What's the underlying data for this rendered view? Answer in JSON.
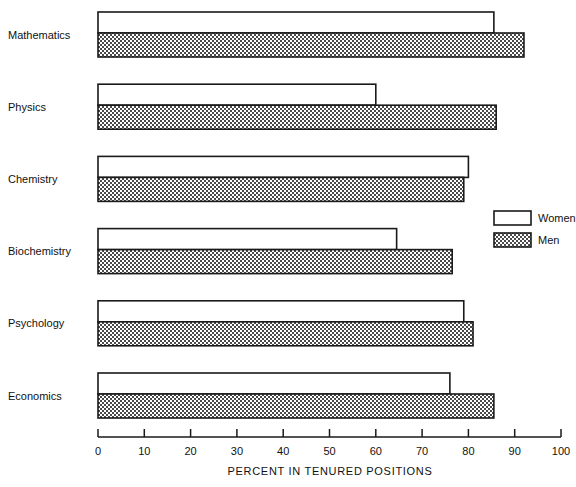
{
  "chart_data": {
    "type": "bar",
    "orientation": "horizontal",
    "title": "",
    "xlabel": "PERCENT IN TENURED POSITIONS",
    "ylabel": "",
    "xlim": [
      0,
      100
    ],
    "xticks": [
      0,
      10,
      20,
      30,
      40,
      50,
      60,
      70,
      80,
      90,
      100
    ],
    "grid": false,
    "legend_position": "middle-right",
    "categories": [
      "Mathematics",
      "Physics",
      "Chemistry",
      "Biochemistry",
      "Psychology",
      "Economics"
    ],
    "series": [
      {
        "name": "Women",
        "fill": "white",
        "values": [
          85.5,
          60.0,
          80.0,
          64.5,
          79.0,
          76.0
        ]
      },
      {
        "name": "Men",
        "fill": "stipple",
        "values": [
          92.0,
          86.0,
          79.0,
          76.5,
          81.0,
          85.5
        ]
      }
    ]
  },
  "legend": {
    "items": [
      {
        "label": "Women",
        "swatch": "white"
      },
      {
        "label": "Men",
        "swatch": "stipple"
      }
    ]
  },
  "axis": {
    "title": "PERCENT IN TENURED POSITIONS",
    "tick_labels": [
      "0",
      "10",
      "20",
      "30",
      "40",
      "50",
      "60",
      "70",
      "80",
      "90",
      "100"
    ]
  },
  "colors": {
    "line": "#1a1a1a",
    "text": "#111111",
    "background": "#ffffff",
    "stipple_ink": "#555555"
  }
}
